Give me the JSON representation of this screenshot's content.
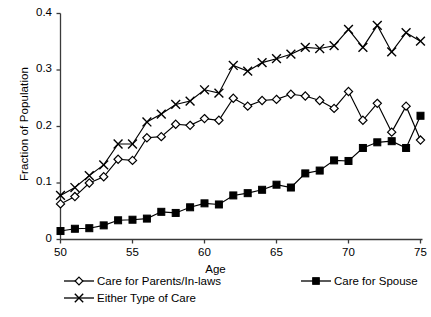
{
  "chart_data": {
    "type": "line",
    "title": "",
    "xlabel": "Age",
    "ylabel": "Fraction of Population",
    "xlim": [
      50,
      75
    ],
    "ylim": [
      0,
      0.4
    ],
    "xticks": [
      "50",
      "55",
      "60",
      "65",
      "70",
      "75"
    ],
    "yticks": [
      "0",
      "0.1",
      "0.2",
      "0.3",
      "0.4"
    ],
    "grid": false,
    "legend_position": "below-axis",
    "x": [
      50,
      51,
      52,
      53,
      54,
      55,
      56,
      57,
      58,
      59,
      60,
      61,
      62,
      63,
      64,
      65,
      66,
      67,
      68,
      69,
      70,
      71,
      72,
      73,
      74,
      75
    ],
    "series": [
      {
        "name": "Care for Parents/In-laws",
        "marker": "open-diamond",
        "values": [
          0.063,
          0.076,
          0.1,
          0.111,
          0.142,
          0.14,
          0.18,
          0.182,
          0.204,
          0.202,
          0.214,
          0.211,
          0.25,
          0.236,
          0.246,
          0.248,
          0.257,
          0.254,
          0.246,
          0.232,
          0.262,
          0.211,
          0.241,
          0.19,
          0.236,
          0.176
        ]
      },
      {
        "name": "Care for Spouse",
        "marker": "filled-square",
        "values": [
          0.015,
          0.019,
          0.02,
          0.025,
          0.034,
          0.035,
          0.037,
          0.049,
          0.047,
          0.057,
          0.064,
          0.062,
          0.078,
          0.082,
          0.088,
          0.097,
          0.092,
          0.117,
          0.122,
          0.14,
          0.139,
          0.162,
          0.172,
          0.174,
          0.162,
          0.219
        ]
      },
      {
        "name": "Either Type of Care",
        "marker": "cross-x",
        "values": [
          0.078,
          0.092,
          0.113,
          0.132,
          0.169,
          0.169,
          0.208,
          0.222,
          0.239,
          0.245,
          0.265,
          0.259,
          0.308,
          0.298,
          0.313,
          0.32,
          0.328,
          0.34,
          0.338,
          0.343,
          0.372,
          0.34,
          0.379,
          0.332,
          0.366,
          0.351
        ]
      }
    ]
  },
  "legend": {
    "items": [
      {
        "label": "Care for Parents/In-laws",
        "marker": "open-diamond"
      },
      {
        "label": "Care for Spouse",
        "marker": "filled-square"
      },
      {
        "label": "Either Type of Care",
        "marker": "cross-x"
      }
    ]
  },
  "axes": {
    "y_title": "Fraction of Population",
    "x_title": "Age"
  },
  "colors": {
    "line": "#000000",
    "marker_fill": "#ffffff",
    "axis": "#3a3a3a",
    "background": "#ffffff"
  }
}
